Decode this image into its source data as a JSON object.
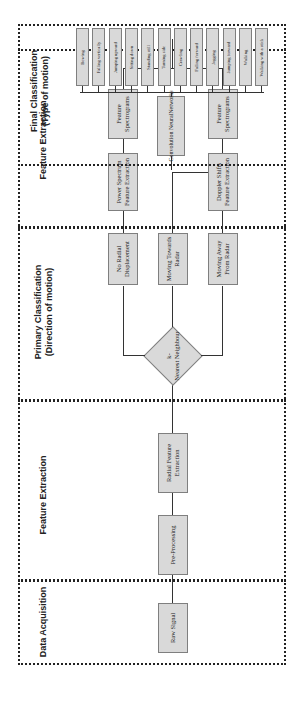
{
  "diagram": {
    "orientation": "rotated-90-ccw",
    "stages": [
      {
        "title": "Data Acquisition"
      },
      {
        "title": "Feature Extraction"
      },
      {
        "title": "Primary Classification\n(Direction of motion)"
      },
      {
        "title": "Feature Extraction"
      },
      {
        "title": "Final Classification\n(Type of motion)"
      }
    ],
    "nodes": {
      "raw_signal": "Raw Signal",
      "pre_processing": "Pre-Processing",
      "radial_feature_extraction": "Radial Feature Extraction",
      "knn": "k-\nNearest Neighbour",
      "no_radial": "No Radial Displacement",
      "moving_towards": "Moving Towards Radar",
      "moving_away": "Moving Away From Radar",
      "power_spectrum": "Power Spectrum Feature Extraction",
      "doppler_shifts": "Doppler Shifts Feature Extraction",
      "feature_spectrograms_1": "Feature Spectrograms",
      "feature_spectrograms_2": "Feature Spectrograms",
      "cnn": "Convolution NeuralNetworks"
    },
    "classes": [
      "Bowing",
      "Falling vertically",
      "Jumping upward",
      "Sitting down",
      "Standing still",
      "Turning side",
      "Crawling",
      "Falling forward",
      "Jogging",
      "Jumping forward",
      "Walking",
      "Walking with a stick"
    ],
    "colors": {
      "box_fill": "#d9d9d9",
      "box_border": "#7f7f7f",
      "line": "#333333",
      "stage_border": "#222222"
    }
  }
}
